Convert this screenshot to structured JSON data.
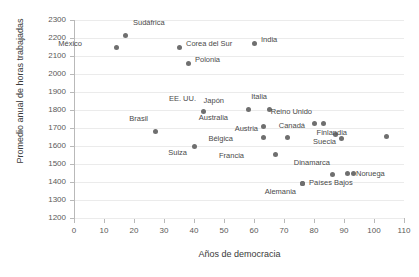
{
  "chart_data": {
    "type": "scatter",
    "title": "",
    "xlabel": "Años de democracia",
    "ylabel": "Promedio anual de horas trabajadas",
    "xlim": [
      0,
      110
    ],
    "ylim": [
      1200,
      2300
    ],
    "xticks": [
      0,
      10,
      20,
      30,
      40,
      50,
      60,
      70,
      80,
      90,
      100,
      110
    ],
    "yticks": [
      1200,
      1300,
      1400,
      1500,
      1600,
      1700,
      1800,
      1900,
      2000,
      2100,
      2200,
      2300
    ],
    "grid": "horizontal",
    "legend": "none",
    "point_color": "#6f6f6f",
    "points": [
      {
        "label": "Sudáfrica",
        "x": 17,
        "y": 2215,
        "lx": 8,
        "ly": -13
      },
      {
        "label": "México",
        "x": 14,
        "y": 2150,
        "lx": -36,
        "ly": -4
      },
      {
        "label": "Corea del Sur",
        "x": 35,
        "y": 2150,
        "lx": 7,
        "ly": -4
      },
      {
        "label": "Polonia",
        "x": 38,
        "y": 2060,
        "lx": 7,
        "ly": -4
      },
      {
        "label": "India",
        "x": 60,
        "y": 2170,
        "lx": 7,
        "ly": -4
      },
      {
        "label": "Brasil",
        "x": 27,
        "y": 1680,
        "lx": -9,
        "ly": -14
      },
      {
        "label": "EE. UU.",
        "x": 43,
        "y": 1790,
        "lx": -9,
        "ly": -14
      },
      {
        "label": "Suiza",
        "x": 40,
        "y": 1600,
        "lx": -9,
        "ly": 6
      },
      {
        "label": "Japón",
        "x": 58,
        "y": 1805,
        "lx": -26,
        "ly": -9
      },
      {
        "label": "Italia",
        "x": 65,
        "y": 1805,
        "lx": -4,
        "ly": -13
      },
      {
        "label": "Australia",
        "x": 63,
        "y": 1710,
        "lx": -37,
        "ly": -9
      },
      {
        "label": "Bélgica",
        "x": 63,
        "y": 1650,
        "lx": -32,
        "ly": 1
      },
      {
        "label": "Austria",
        "x": 71,
        "y": 1645,
        "lx": -31,
        "ly": -10
      },
      {
        "label": "Francia",
        "x": 67,
        "y": 1555,
        "lx": -33,
        "ly": 1
      },
      {
        "label": "Reino Unido",
        "x": 80,
        "y": 1725,
        "lx": -4,
        "ly": -13
      },
      {
        "label": "",
        "x": 83,
        "y": 1725,
        "lx": 0,
        "ly": 0
      },
      {
        "label": "Canadá",
        "x": 87,
        "y": 1665,
        "lx": -32,
        "ly": -9
      },
      {
        "label": "Suecia",
        "x": 89,
        "y": 1640,
        "lx": -7,
        "ly": 2
      },
      {
        "label": "Finlandia",
        "x": 104,
        "y": 1655,
        "lx": -41,
        "ly": -4
      },
      {
        "label": "Dinamarca",
        "x": 86,
        "y": 1440,
        "lx": -4,
        "ly": -13
      },
      {
        "label": "Noruega",
        "x": 91,
        "y": 1445,
        "lx": 9,
        "ly": -1
      },
      {
        "label": "",
        "x": 93,
        "y": 1445,
        "lx": 0,
        "ly": 0
      },
      {
        "label": "Países Bajos",
        "x": 76,
        "y": 1390,
        "lx": 7,
        "ly": -2
      },
      {
        "label": "Alemania",
        "x": 76,
        "y": 1390,
        "lx": -8,
        "ly": 7
      }
    ]
  }
}
